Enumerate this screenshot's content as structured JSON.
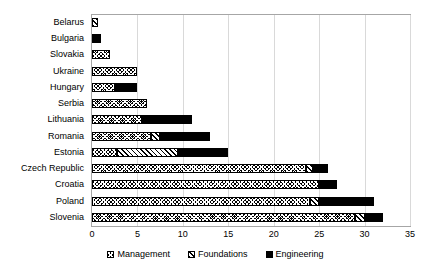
{
  "chart_data": {
    "type": "bar",
    "orientation": "horizontal",
    "stacked": true,
    "title": "",
    "xlabel": "",
    "ylabel": "",
    "xlim": [
      0,
      35
    ],
    "xticks": [
      0,
      5,
      10,
      15,
      20,
      25,
      30,
      35
    ],
    "grid": true,
    "legend_position": "bottom",
    "categories": [
      "Belarus",
      "Bulgaria",
      "Slovakia",
      "Ukraine",
      "Hungary",
      "Serbia",
      "Lithuania",
      "Romania",
      "Estonia",
      "Czech Republic",
      "Croatia",
      "Poland",
      "Slovenia"
    ],
    "series": [
      {
        "name": "Management",
        "pattern": "cross-hatch",
        "color": "#000000",
        "values": [
          0,
          0,
          2,
          5,
          2.5,
          6,
          5.5,
          6.5,
          2.8,
          23.5,
          25,
          24,
          29
        ]
      },
      {
        "name": "Foundations",
        "pattern": "diagonal-hatch",
        "color": "#000000",
        "values": [
          0.7,
          0,
          0,
          0,
          0,
          0,
          0,
          1,
          6.7,
          0.8,
          0,
          1,
          1
        ]
      },
      {
        "name": "Engineering",
        "pattern": "solid",
        "color": "#000000",
        "values": [
          0,
          1,
          0,
          0,
          2.5,
          0,
          5.5,
          5.5,
          5.5,
          1.7,
          2,
          6,
          2
        ]
      }
    ],
    "totals": [
      0.7,
      1,
      2,
      5,
      5,
      6,
      11,
      13,
      15,
      26,
      27,
      31,
      32
    ]
  },
  "legend": {
    "items": [
      {
        "label": "Management",
        "swatch": "cross-hatch-swatch"
      },
      {
        "label": "Foundations",
        "swatch": "diagonal-hatch-swatch"
      },
      {
        "label": "Engineering",
        "swatch": "solid-black-swatch"
      }
    ]
  }
}
